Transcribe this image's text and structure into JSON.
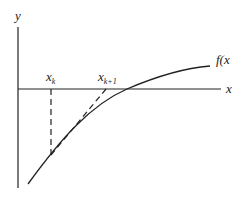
{
  "diagram": {
    "labels": {
      "y_axis": "y",
      "x_axis": "x",
      "function": "f(x",
      "xk_base": "x",
      "xk_sub": "k",
      "xk1_base": "x",
      "xk1_sub": "k+1"
    },
    "colors": {
      "line": "#222222",
      "background": "#ffffff"
    }
  }
}
